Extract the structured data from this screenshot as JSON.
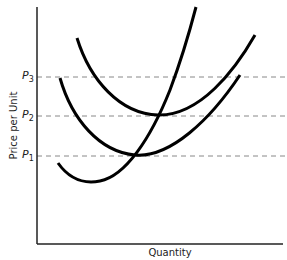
{
  "diagram": {
    "type": "economics cost curves",
    "xlabel": "Quantity",
    "ylabel": "Price per Unit",
    "price_levels": [
      {
        "symbol": "P",
        "sub": "3",
        "y": 77
      },
      {
        "symbol": "P",
        "sub": "2",
        "y": 116
      },
      {
        "symbol": "P",
        "sub": "1",
        "y": 156
      }
    ],
    "curves": [
      {
        "name": "rising-curve",
        "path": "M58,163 C70,180 85,184 100,181 C125,176 150,140 170,90 C182,58 190,30 196,7"
      },
      {
        "name": "lower-u-curve",
        "path": "M60,78 C72,120 100,152 135,155 C170,158 210,120 240,75"
      },
      {
        "name": "upper-u-curve",
        "path": "M77,38 C90,80 120,114 158,115 C200,116 235,70 255,35"
      }
    ],
    "colors": {
      "axis": "#222222",
      "curve": "#000000",
      "dash": "#888888"
    }
  }
}
